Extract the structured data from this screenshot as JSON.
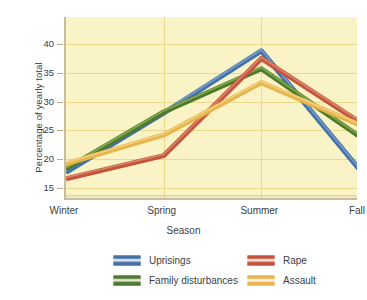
{
  "chart_data": {
    "type": "line",
    "title": "",
    "xlabel": "Season",
    "ylabel": "Percentage of yearly total",
    "categories": [
      "Winter",
      "Spring",
      "Summer",
      "Fall"
    ],
    "ylim": [
      12.9,
      44.7
    ],
    "yticks": [
      15,
      20,
      25,
      30,
      35,
      40
    ],
    "ytick_labels": [
      "15",
      "20",
      "25",
      "30",
      "35",
      "40"
    ],
    "grid": "horizontal and vertical, faint gold on pale yellow panel",
    "legend_position": "below plot, two columns",
    "series": [
      {
        "name": "Uprisings",
        "color": "#4472a8",
        "highlight": "#7fa3cf",
        "values": [
          17.7,
          28.0,
          38.8,
          18.3
        ]
      },
      {
        "name": "Family disturbances",
        "color": "#4f7a2a",
        "highlight": "#8cb258",
        "values": [
          18.3,
          28.2,
          35.7,
          24.0
        ]
      },
      {
        "name": "Rape",
        "color": "#c4553c",
        "highlight": "#dd8e6f",
        "values": [
          16.6,
          20.6,
          37.5,
          26.5
        ]
      },
      {
        "name": "Assault",
        "color": "#e8b54a",
        "highlight": "#f4d489",
        "values": [
          19.2,
          24.2,
          33.3,
          26.0
        ]
      }
    ]
  },
  "axes": {
    "y_title": "Percentage of yearly total",
    "x_title": "Season",
    "x_tick_labels": [
      "Winter",
      "Spring",
      "Summer",
      "Fall"
    ],
    "y_tick_labels": [
      "15",
      "20",
      "25",
      "30",
      "35",
      "40"
    ]
  },
  "legend": {
    "entries": [
      {
        "label": "Uprisings",
        "color": "#4472a8"
      },
      {
        "label": "Family disturbances",
        "color": "#4f7a2a"
      },
      {
        "label": "Rape",
        "color": "#c4553c"
      },
      {
        "label": "Assault",
        "color": "#e8b54a"
      }
    ]
  },
  "colors": {
    "panel_background": "#faf3c6",
    "gridline": "#e8d98c",
    "axis": "#c9bda0",
    "text": "#3d3d3d",
    "page_background": "#ffffff"
  }
}
